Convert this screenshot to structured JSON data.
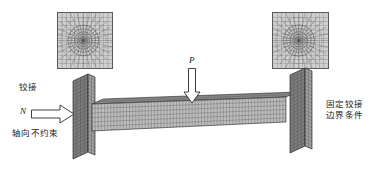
{
  "figure": {
    "type": "fea-model-diagram",
    "background_color": "#ffffff"
  },
  "labels": {
    "hinged": "铰接",
    "axial_unconstrained": "轴向不约束",
    "fixed_hinge_line1": "固定铰接",
    "fixed_hinge_line2": "边界条件",
    "load_vertical": "P",
    "load_axial": "N"
  },
  "insets": {
    "left": {
      "name": "cross-section-mesh-left",
      "x": 57,
      "y": 12,
      "w": 54,
      "h": 55,
      "border_color": "#5a5a5a",
      "fill_color": "#cfcfcf",
      "line_color": "#4a4a4a"
    },
    "right": {
      "name": "cross-section-mesh-right",
      "x": 272,
      "y": 12,
      "w": 55,
      "h": 55,
      "border_color": "#5a5a5a",
      "fill_color": "#cfcfcf",
      "line_color": "#4a4a4a"
    }
  },
  "arrows": {
    "vertical": {
      "x": 183,
      "y": 68,
      "w": 16,
      "h": 34,
      "direction": "down"
    },
    "horizontal": {
      "x": 31,
      "y": 104,
      "w": 42,
      "h": 18,
      "direction": "right"
    }
  },
  "colors": {
    "mesh_line": "#4a4a4a",
    "plate_fill": "#8d8d8d",
    "plate_fill_dark": "#6f6f6f",
    "web_fill": "#b8b8b8",
    "web_fill_top": "#9e9e9e",
    "outline": "#3a3a3a",
    "text": "#1a1a1a"
  }
}
